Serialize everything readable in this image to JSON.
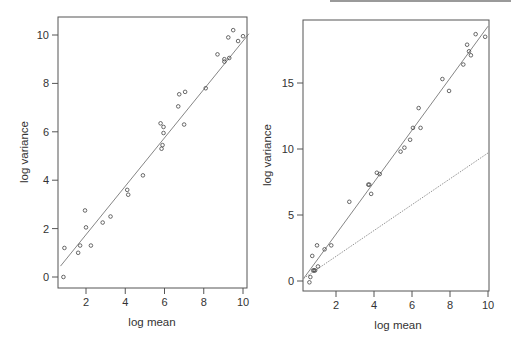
{
  "chart_data": [
    {
      "type": "scatter",
      "title": "",
      "xlabel": "log mean",
      "ylabel": "log variance",
      "xlim": [
        0.7,
        10.3
      ],
      "ylim": [
        -0.45,
        10.7
      ],
      "xticks": [
        2,
        4,
        6,
        8,
        10
      ],
      "yticks": [
        0,
        2,
        4,
        6,
        8,
        10
      ],
      "grid": false,
      "legend": null,
      "series": [
        {
          "name": "points",
          "marker": "open-circle",
          "x": [
            0.85,
            0.9,
            1.6,
            1.7,
            1.95,
            2.0,
            2.25,
            2.85,
            3.25,
            4.1,
            4.15,
            4.9,
            5.8,
            5.85,
            5.9,
            5.95,
            5.95,
            6.7,
            6.75,
            7.0,
            7.05,
            8.1,
            8.7,
            9.05,
            9.05,
            9.25,
            9.3,
            9.5,
            9.75,
            10.0
          ],
          "y": [
            0.0,
            1.2,
            1.0,
            1.3,
            2.75,
            2.05,
            1.3,
            2.25,
            2.5,
            3.6,
            3.4,
            4.2,
            6.35,
            5.3,
            5.45,
            5.95,
            6.2,
            7.05,
            7.55,
            6.3,
            7.65,
            7.8,
            9.2,
            8.9,
            9.0,
            9.9,
            9.05,
            10.2,
            9.75,
            9.95
          ]
        },
        {
          "name": "fitted line",
          "type": "line",
          "style": "solid",
          "x": [
            0.7,
            10.3
          ],
          "y": [
            0.45,
            10.05
          ]
        }
      ]
    },
    {
      "type": "scatter",
      "title": "",
      "xlabel": "log mean",
      "ylabel": "log variance",
      "xlim": [
        0.3,
        10.0
      ],
      "ylim": [
        -0.8,
        19.4
      ],
      "xticks": [
        2,
        4,
        6,
        8,
        10
      ],
      "yticks": [
        0,
        5,
        10,
        15
      ],
      "grid": false,
      "legend": null,
      "series": [
        {
          "name": "points",
          "marker": "open-circle",
          "x": [
            0.6,
            0.65,
            0.75,
            0.8,
            0.85,
            0.9,
            1.0,
            1.05,
            1.4,
            1.75,
            2.7,
            3.7,
            3.75,
            3.85,
            4.15,
            4.3,
            5.4,
            5.6,
            5.9,
            6.05,
            6.35,
            6.45,
            7.6,
            7.95,
            8.7,
            8.9,
            9.0,
            9.1,
            9.35,
            9.85
          ],
          "y": [
            -0.1,
            0.3,
            1.9,
            0.8,
            0.8,
            0.8,
            2.7,
            1.1,
            2.4,
            2.7,
            6.0,
            7.3,
            7.3,
            6.6,
            8.2,
            8.1,
            9.8,
            10.1,
            10.7,
            11.6,
            13.1,
            11.6,
            15.3,
            14.4,
            16.4,
            17.9,
            17.4,
            17.1,
            18.7,
            18.5
          ]
        },
        {
          "name": "fitted line",
          "type": "line",
          "style": "solid",
          "x": [
            0.3,
            10.0
          ],
          "y": [
            0.2,
            19.3
          ]
        },
        {
          "name": "reference line",
          "type": "line",
          "style": "dotted",
          "x": [
            0.3,
            10.0
          ],
          "y": [
            0.2,
            9.7
          ]
        }
      ]
    }
  ],
  "panels": {
    "left": {
      "xlabel": "log mean",
      "ylabel": "log variance",
      "xticks": [
        "2",
        "4",
        "6",
        "8",
        "10"
      ],
      "yticks": [
        "0",
        "2",
        "4",
        "6",
        "8",
        "10"
      ]
    },
    "right": {
      "xlabel": "log mean",
      "ylabel": "log variance",
      "xticks": [
        "2",
        "4",
        "6",
        "8",
        "10"
      ],
      "yticks": [
        "0",
        "5",
        "10",
        "15"
      ]
    }
  },
  "colors": {
    "axis": "#555555",
    "points": "#444444",
    "fit_line": "#666666",
    "reference_line": "#888888"
  }
}
